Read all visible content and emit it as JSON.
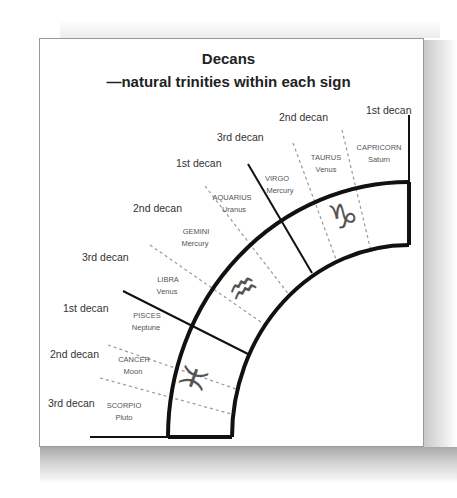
{
  "title": {
    "line1": "Decans",
    "line2": "—natural trinities within each sign"
  },
  "decan_labels": [
    {
      "text": "1st decan",
      "x": 366,
      "y": 114
    },
    {
      "text": "2nd decan",
      "x": 279,
      "y": 121
    },
    {
      "text": "3rd decan",
      "x": 217,
      "y": 141
    },
    {
      "text": "1st decan",
      "x": 176,
      "y": 167
    },
    {
      "text": "2nd decan",
      "x": 133,
      "y": 212
    },
    {
      "text": "3rd decan",
      "x": 82,
      "y": 261
    },
    {
      "text": "1st decan",
      "x": 63,
      "y": 312
    },
    {
      "text": "2nd decan",
      "x": 50,
      "y": 358
    },
    {
      "text": "3rd decan",
      "x": 48,
      "y": 407
    }
  ],
  "sign_labels": [
    {
      "sign": "CAPRICORN",
      "ruler": "Saturn",
      "x": 379,
      "y": 150
    },
    {
      "sign": "TAURUS",
      "ruler": "Venus",
      "x": 326,
      "y": 160
    },
    {
      "sign": "VIRGO",
      "ruler": "Mercury",
      "x": 277,
      "y": 181
    },
    {
      "sign": "AQUARIUS",
      "ruler": "Uranus",
      "x": 232,
      "y": 200
    },
    {
      "sign": "GEMINI",
      "ruler": "Mercury",
      "x": 194,
      "y": 234
    },
    {
      "sign": "LIBRA",
      "ruler": "Venus",
      "x": 168,
      "y": 282
    },
    {
      "sign": "PISCES",
      "ruler": "Neptune",
      "x": 147,
      "y": 318
    },
    {
      "sign": "CANCER",
      "ruler": "Moon",
      "x": 136,
      "y": 362
    },
    {
      "sign": "SCORPIO",
      "ruler": "Pluto",
      "x": 124,
      "y": 408
    }
  ],
  "glyphs": [
    {
      "name": "capricorn",
      "char": "♑",
      "x": 343,
      "y": 226
    },
    {
      "name": "aquarius",
      "char": "♒",
      "x": 243,
      "y": 296
    },
    {
      "name": "pisces",
      "char": "♓",
      "x": 194,
      "y": 382
    }
  ],
  "colors": {
    "line": "#111111",
    "dash": "#9a9a9a",
    "text": "#333333",
    "glyph": "#555555"
  }
}
